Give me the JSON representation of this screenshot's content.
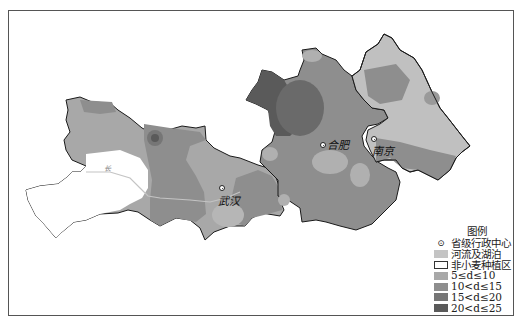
{
  "map": {
    "type": "choropleth",
    "colors": {
      "water": "#c4c4c4",
      "non_wheat": "#ffffff",
      "class_5_10": "#a8a8a8",
      "class_10_15": "#8e8e8e",
      "class_15_20": "#767676",
      "class_20_25": "#5a5a5a",
      "border": "#1a1a1a"
    },
    "cities": [
      {
        "name": "武汉",
        "x": 222,
        "y": 188
      },
      {
        "name": "合肥",
        "x": 323,
        "y": 145
      },
      {
        "name": "南京",
        "x": 374,
        "y": 139
      }
    ],
    "river_label": "长"
  },
  "legend": {
    "title": "图例",
    "items": [
      {
        "symbol": "⊙",
        "label": "省级行政中心",
        "kind": "point"
      },
      {
        "label": "河流及湖泊",
        "color": "#c4c4c4",
        "kind": "fill"
      },
      {
        "label": "非小麦种植区",
        "color": "#ffffff",
        "kind": "fill"
      },
      {
        "label": "5≤d≤10",
        "color": "#a8a8a8",
        "kind": "fill"
      },
      {
        "label": "10<d≤15",
        "color": "#8e8e8e",
        "kind": "fill"
      },
      {
        "label": "15<d≤20",
        "color": "#767676",
        "kind": "fill"
      },
      {
        "label": "20<d≤25",
        "color": "#5a5a5a",
        "kind": "fill"
      }
    ]
  }
}
